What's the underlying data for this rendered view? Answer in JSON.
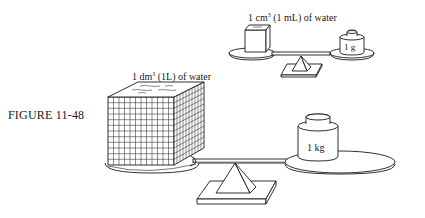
{
  "figure": {
    "caption": "FIGURE 11-48"
  },
  "small_scale": {
    "label_prefix": "1 cm",
    "label_exponent": "3",
    "label_suffix": " (1 mL) of water",
    "weight_label": "1 g"
  },
  "large_scale": {
    "label_prefix": "1 dm",
    "label_exponent": "3",
    "label_suffix": " (1L) of water",
    "weight_label": "1 kg"
  },
  "colors": {
    "line": "#1a1a1a",
    "background": "#ffffff"
  }
}
